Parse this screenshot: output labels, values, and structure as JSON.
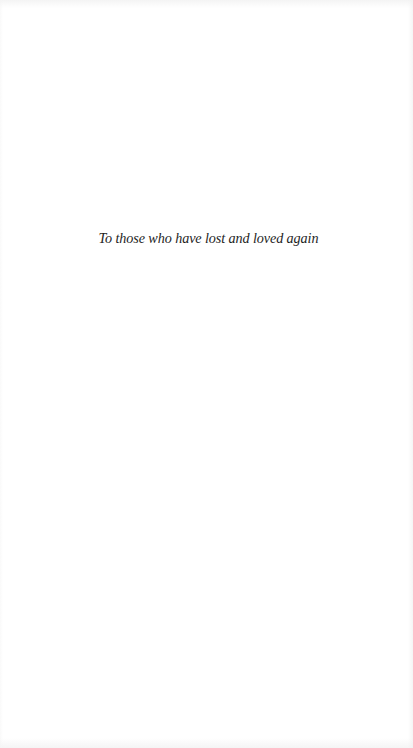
{
  "page": {
    "type": "dedication",
    "background_color": "#ffffff",
    "text_color": "#1e1e1e"
  },
  "dedication": {
    "text": "To those who have lost and loved again"
  }
}
